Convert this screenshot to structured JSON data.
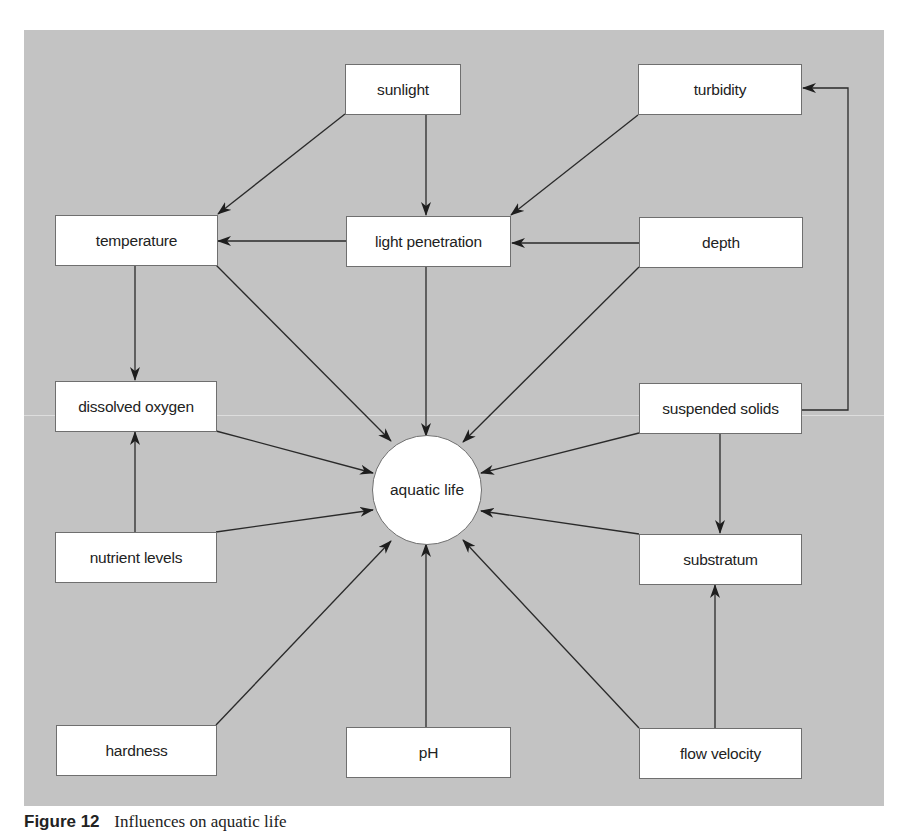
{
  "diagram": {
    "title": "Influences on aquatic life",
    "hub": {
      "id": "aquatic_life",
      "label": "aquatic life"
    },
    "nodes": {
      "sunlight": "sunlight",
      "turbidity": "turbidity",
      "temperature": "temperature",
      "light_penetration": "light penetration",
      "depth": "depth",
      "dissolved_oxygen": "dissolved oxygen",
      "suspended_solids": "suspended solids",
      "nutrient_levels": "nutrient levels",
      "substratum": "substratum",
      "hardness": "hardness",
      "ph": "pH",
      "flow_velocity": "flow velocity"
    },
    "edges": [
      {
        "from": "sunlight",
        "to": "temperature"
      },
      {
        "from": "sunlight",
        "to": "light_penetration"
      },
      {
        "from": "turbidity",
        "to": "light_penetration"
      },
      {
        "from": "light_penetration",
        "to": "temperature"
      },
      {
        "from": "depth",
        "to": "light_penetration"
      },
      {
        "from": "suspended_solids",
        "to": "turbidity"
      },
      {
        "from": "temperature",
        "to": "dissolved_oxygen"
      },
      {
        "from": "nutrient_levels",
        "to": "dissolved_oxygen"
      },
      {
        "from": "suspended_solids",
        "to": "substratum"
      },
      {
        "from": "flow_velocity",
        "to": "substratum"
      },
      {
        "from": "temperature",
        "to": "aquatic_life"
      },
      {
        "from": "light_penetration",
        "to": "aquatic_life"
      },
      {
        "from": "depth",
        "to": "aquatic_life"
      },
      {
        "from": "dissolved_oxygen",
        "to": "aquatic_life"
      },
      {
        "from": "suspended_solids",
        "to": "aquatic_life"
      },
      {
        "from": "nutrient_levels",
        "to": "aquatic_life"
      },
      {
        "from": "substratum",
        "to": "aquatic_life"
      },
      {
        "from": "hardness",
        "to": "aquatic_life"
      },
      {
        "from": "ph",
        "to": "aquatic_life"
      },
      {
        "from": "flow_velocity",
        "to": "aquatic_life"
      }
    ],
    "colors": {
      "panel": "#c3c3c3",
      "box": "#ffffff",
      "line": "#2a2a2a"
    }
  },
  "caption": {
    "label": "Figure 12",
    "text": "Influences on aquatic life"
  }
}
